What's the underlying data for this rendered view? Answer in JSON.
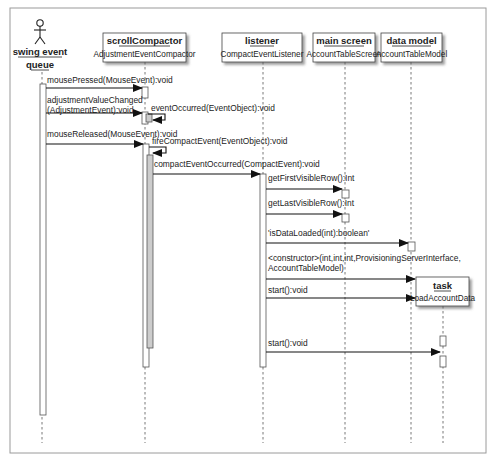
{
  "diagram": {
    "type": "UML sequence diagram",
    "participants": [
      {
        "id": "swing",
        "name_line1": "swing event",
        "name_line2": "queue",
        "kind": "actor"
      },
      {
        "id": "scroll",
        "name": "scrollCompactor",
        "class": "AdjustmentEventCompactor"
      },
      {
        "id": "listener",
        "name": "listener",
        "class": "CompactEventListener"
      },
      {
        "id": "main",
        "name": "main screen",
        "class": "AccountTableScreen"
      },
      {
        "id": "model",
        "name": "data model",
        "class": "AccountTableModel"
      },
      {
        "id": "task",
        "name": "task",
        "class": "LoadAccountData"
      }
    ],
    "messages": [
      {
        "from": "swing",
        "to": "scroll",
        "label": "mousePressed(MouseEvent):void"
      },
      {
        "from": "swing",
        "to": "scroll",
        "label_line1": "adjustmentValueChanged",
        "label_line2": "(AdjustmentEvent):void"
      },
      {
        "from": "scroll",
        "to": "scroll",
        "label": "eventOccurred(EventObject):void"
      },
      {
        "from": "swing",
        "to": "scroll",
        "label": "mouseReleased(MouseEvent):void"
      },
      {
        "from": "scroll",
        "to": "scroll",
        "label": "fireCompactEvent(EventObject):void"
      },
      {
        "from": "scroll",
        "to": "listener",
        "label": "compactEventOccurred(CompactEvent):void"
      },
      {
        "from": "listener",
        "to": "main",
        "label": "getFirstVisibleRow():Int"
      },
      {
        "from": "listener",
        "to": "main",
        "label": "getLastVisibleRow():Int"
      },
      {
        "from": "listener",
        "to": "model",
        "label": "'isDataLoaded(int):boolean'"
      },
      {
        "from": "listener",
        "to": "task",
        "label_line1": "<constructor>(int,int,int,ProvisioningServerInterface,",
        "label_line2": "AccountTableModel)"
      },
      {
        "from": "listener",
        "to": "task",
        "label": "start():void"
      },
      {
        "from": "listener",
        "to": "task",
        "label": "start():void"
      }
    ]
  }
}
